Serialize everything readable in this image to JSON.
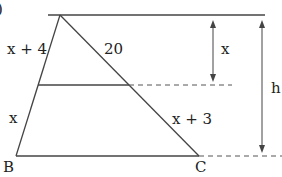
{
  "figure": {
    "corner_label": ")",
    "labels": {
      "upper_left_side": "x + 4",
      "lower_left_side": "x",
      "upper_right_side": "20",
      "lower_right_side": "x + 3",
      "small_height": "x",
      "total_height": "h",
      "vertex_b": "B",
      "vertex_c": "C"
    },
    "colors": {
      "line": "#444444",
      "text": "#222222"
    }
  }
}
